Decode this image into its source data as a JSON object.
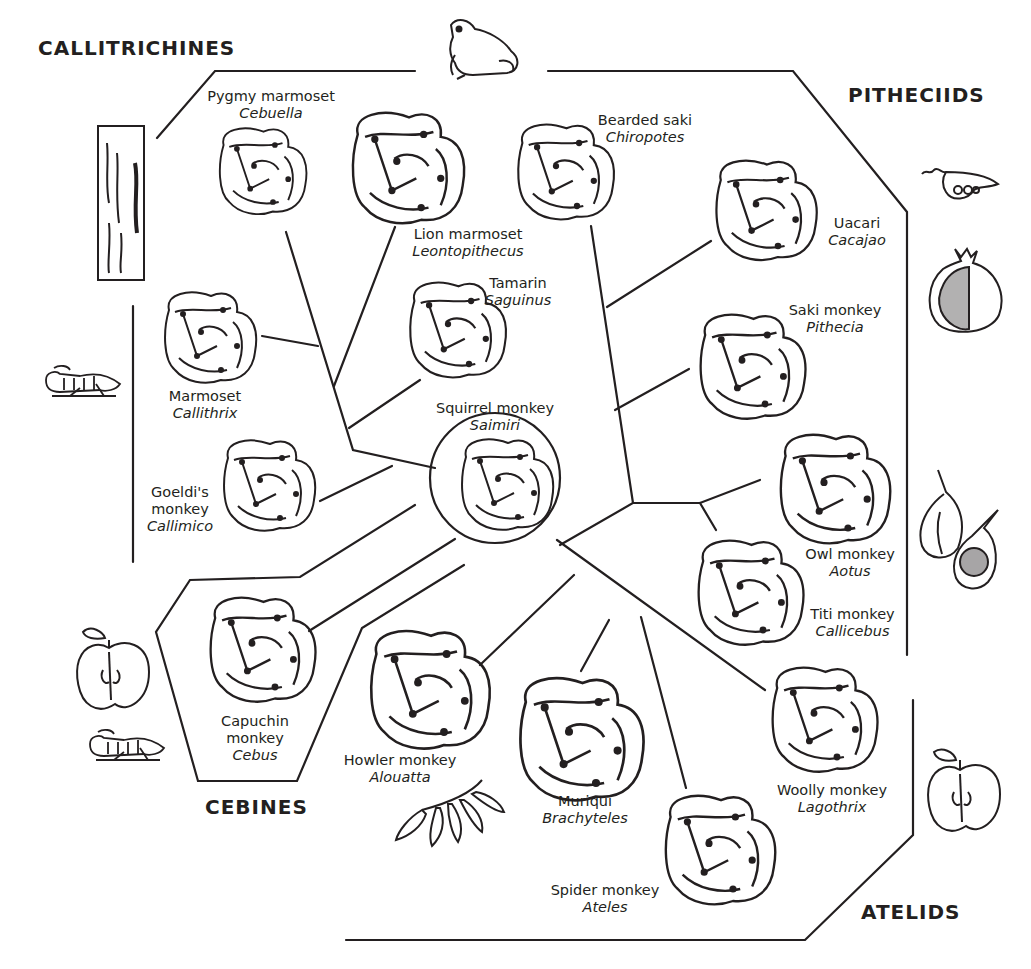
{
  "groups": {
    "callitrichines": "CALLITRICHINES",
    "pitheciids": "PITHECIIDS",
    "cebines": "CEBINES",
    "atelids": "ATELIDS"
  },
  "species": {
    "pygmy_marmoset": {
      "common": "Pygmy marmoset",
      "genus": "Cebuella"
    },
    "lion_marmoset": {
      "common": "Lion marmoset",
      "genus": "Leontopithecus"
    },
    "tamarin": {
      "common": "Tamarin",
      "genus": "Saguinus"
    },
    "marmoset": {
      "common": "Marmoset",
      "genus": "Callithrix"
    },
    "goeldis_monkey": {
      "common1": "Goeldi's",
      "common2": "monkey",
      "genus": "Callimico"
    },
    "squirrel_monkey": {
      "common": "Squirrel monkey",
      "genus": "Saimiri"
    },
    "bearded_saki": {
      "common": "Bearded saki",
      "genus": "Chiropotes"
    },
    "uacari": {
      "common": "Uacari",
      "genus": "Cacajao"
    },
    "saki_monkey": {
      "common": "Saki monkey",
      "genus": "Pithecia"
    },
    "owl_monkey": {
      "common": "Owl monkey",
      "genus": "Aotus"
    },
    "titi_monkey": {
      "common": "Titi monkey",
      "genus": "Callicebus"
    },
    "capuchin_monkey": {
      "common1": "Capuchin",
      "common2": "monkey",
      "genus": "Cebus"
    },
    "howler_monkey": {
      "common": "Howler monkey",
      "genus": "Alouatta"
    },
    "muriqui": {
      "common": "Muriqui",
      "genus": "Brachyteles"
    },
    "spider_monkey": {
      "common": "Spider monkey",
      "genus": "Ateles"
    },
    "woolly_monkey": {
      "common": "Woolly monkey",
      "genus": "Lagothrix"
    }
  },
  "diet_icons": {
    "callitrichines": [
      "tree-bark-gum",
      "grasshopper"
    ],
    "top": [
      "frog"
    ],
    "pitheciids": [
      "seed-pod",
      "pomegranate",
      "figs"
    ],
    "cebines": [
      "apple",
      "grasshopper"
    ],
    "atelids": [
      "apple"
    ],
    "howler": [
      "leaves"
    ]
  },
  "colors": {
    "ink": "#231f20",
    "background": "#ffffff"
  }
}
